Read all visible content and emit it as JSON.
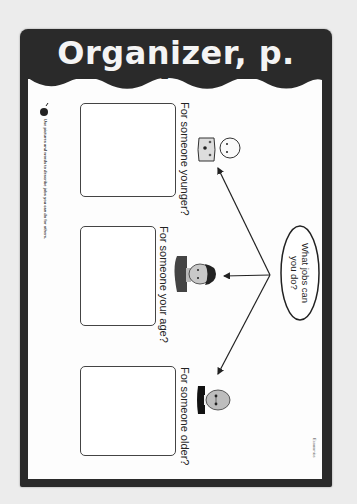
{
  "header": {
    "title": "Organizer, p. E18"
  },
  "instructions": {
    "icon": "apple-icon",
    "text": "Use pictures and words to describe jobs you can do for others."
  },
  "center_bubble": {
    "text_line1": "What jobs can",
    "text_line2": "you do?"
  },
  "sections": [
    {
      "question": "For someone younger?",
      "figure": "baby-icon"
    },
    {
      "question": "For someone your age?",
      "figure": "child-icon"
    },
    {
      "question": "For someone older?",
      "figure": "elderly-man-icon"
    }
  ],
  "footer": {
    "subject": "Economics"
  },
  "colors": {
    "frame": "#2a2a2a",
    "paper": "#fdfdfd",
    "background": "#ececec",
    "title_text": "#f4f4f4"
  }
}
